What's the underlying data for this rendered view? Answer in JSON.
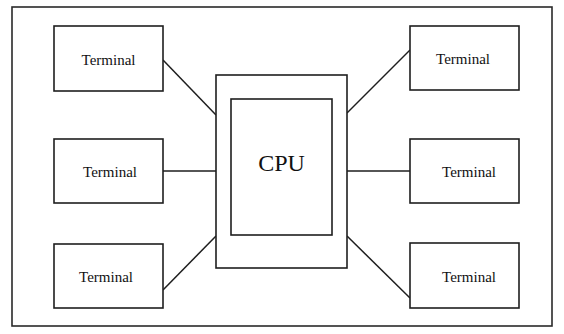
{
  "diagram": {
    "type": "star-topology",
    "cpu": {
      "label": "CPU",
      "outer": {
        "x": 216,
        "y": 75,
        "w": 131,
        "h": 193
      },
      "inner": {
        "x": 231,
        "y": 99,
        "w": 101,
        "h": 136
      }
    },
    "terminals": [
      {
        "id": "left-top",
        "label": "Terminal",
        "x": 54,
        "y": 26,
        "w": 109,
        "h": 65
      },
      {
        "id": "left-middle",
        "label": "Terminal",
        "x": 54,
        "y": 139,
        "w": 109,
        "h": 64
      },
      {
        "id": "left-bottom",
        "label": "Terminal",
        "x": 54,
        "y": 244,
        "w": 109,
        "h": 64
      },
      {
        "id": "right-top",
        "label": "Terminal",
        "x": 410,
        "y": 26,
        "w": 109,
        "h": 64
      },
      {
        "id": "right-middle",
        "label": "Terminal",
        "x": 410,
        "y": 139,
        "w": 109,
        "h": 64
      },
      {
        "id": "right-bottom",
        "label": "Terminal",
        "x": 410,
        "y": 243,
        "w": 109,
        "h": 65
      }
    ],
    "connections": [
      {
        "from": "left-top",
        "to": "cpu",
        "x1": 163,
        "y1": 60,
        "x2": 216,
        "y2": 115
      },
      {
        "from": "left-middle",
        "to": "cpu",
        "x1": 163,
        "y1": 171,
        "x2": 216,
        "y2": 171
      },
      {
        "from": "left-bottom",
        "to": "cpu",
        "x1": 163,
        "y1": 290,
        "x2": 216,
        "y2": 236
      },
      {
        "from": "right-top",
        "to": "cpu",
        "x1": 410,
        "y1": 50,
        "x2": 347,
        "y2": 113
      },
      {
        "from": "right-middle",
        "to": "cpu",
        "x1": 410,
        "y1": 171,
        "x2": 347,
        "y2": 171
      },
      {
        "from": "right-bottom",
        "to": "cpu",
        "x1": 410,
        "y1": 298,
        "x2": 347,
        "y2": 236
      }
    ],
    "frame": {
      "x": 12,
      "y": 7,
      "w": 540,
      "h": 319
    }
  }
}
